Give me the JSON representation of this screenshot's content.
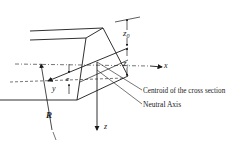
{
  "diagram": {
    "labels": {
      "centroid": "Centroid of the cross section",
      "neutral_axis": "Neutral Axis",
      "x_axis": "x",
      "y_axis": "y",
      "z_axis": "z",
      "radius": "R",
      "eccentricity": "e",
      "z_outer": "z",
      "z_outer_sub": "0",
      "z_inner": "z",
      "z_inner_sub": "i"
    },
    "colors": {
      "line": "#1a1a1a",
      "background": "#ffffff"
    }
  }
}
